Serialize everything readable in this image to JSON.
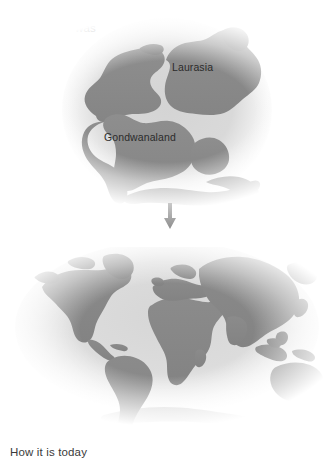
{
  "figure": {
    "type": "diagram",
    "background_color": "#ffffff",
    "land_color": "#8a8a8a",
    "sea_color": "#d8d8d8",
    "text_color": "#3a3a3a",
    "arrow_color": "#9a9a9a"
  },
  "panels": [
    {
      "id": "past",
      "caption": "How it once was",
      "map": "pangaea",
      "labels": [
        {
          "id": "laurasia",
          "text": "Laurasia"
        },
        {
          "id": "gondwanaland",
          "text": "Gondwanaland"
        }
      ]
    },
    {
      "id": "today",
      "caption": "How it is today",
      "map": "modern-world",
      "labels": []
    }
  ],
  "connector": {
    "icon": "arrow-down-icon",
    "direction": "down",
    "color": "#9a9a9a"
  }
}
